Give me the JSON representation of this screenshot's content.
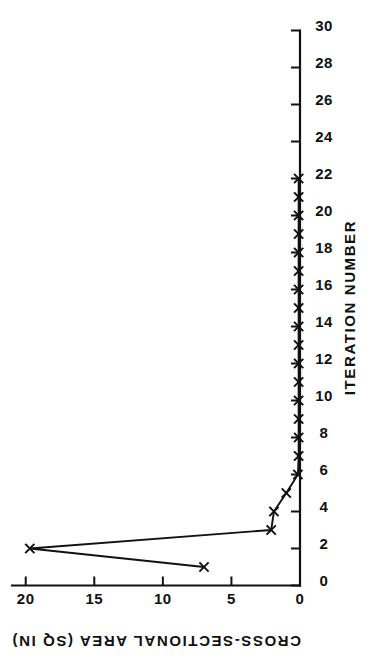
{
  "chart_data": {
    "type": "line",
    "title": "",
    "xlabel": "ITERATION NUMBER",
    "ylabel": "CROSS-SECTIONAL AREA (SQ IN)",
    "xlim": [
      0,
      30
    ],
    "ylim": [
      0,
      21
    ],
    "xticks": [
      0,
      2,
      4,
      6,
      8,
      10,
      12,
      14,
      16,
      18,
      20,
      22,
      24,
      26,
      28,
      30
    ],
    "xticklabels": [
      "0",
      "2",
      "4",
      "6",
      "8",
      "10",
      "12",
      "14",
      "16",
      "18",
      "20",
      "22",
      "24",
      "26",
      "28",
      "30"
    ],
    "yticks": [
      0,
      5,
      10,
      15,
      20
    ],
    "yticklabels": [
      "0",
      "5",
      "10",
      "15",
      "20"
    ],
    "grid": false,
    "legend": null,
    "marker": "x",
    "orientation": "rotated-90-clockwise",
    "x": [
      1,
      2,
      3,
      4,
      5,
      6,
      7,
      8,
      9,
      10,
      11,
      12,
      13,
      14,
      15,
      16,
      17,
      18,
      19,
      20,
      21,
      22
    ],
    "values": [
      7.0,
      19.7,
      2.1,
      1.9,
      1.0,
      0.15,
      0.1,
      0.1,
      0.1,
      0.1,
      0.1,
      0.1,
      0.1,
      0.1,
      0.1,
      0.1,
      0.1,
      0.1,
      0.1,
      0.1,
      0.1,
      0.1
    ],
    "series": [
      {
        "name": "cross-sectional area",
        "values": [
          7.0,
          19.7,
          2.1,
          1.9,
          1.0,
          0.15,
          0.1,
          0.1,
          0.1,
          0.1,
          0.1,
          0.1,
          0.1,
          0.1,
          0.1,
          0.1,
          0.1,
          0.1,
          0.1,
          0.1,
          0.1,
          0.1
        ]
      }
    ],
    "colors": {
      "line": "#111111",
      "marker": "#111111",
      "axis": "#111111",
      "background": "#ffffff"
    }
  }
}
